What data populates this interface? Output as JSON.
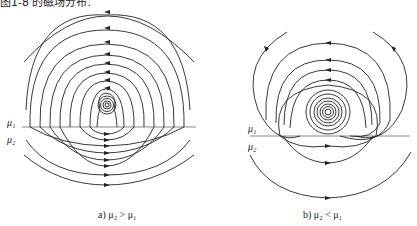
{
  "top_text": "图1-8 的磁场分布.",
  "figures": [
    {
      "id": "a",
      "caption": "a) μ₂ > μ₁",
      "label_upper": "μ₁",
      "label_lower": "μ₂"
    },
    {
      "id": "b",
      "caption": "b) μ₂ < μ₁",
      "label_upper": "μ₁",
      "label_lower": "μ₂"
    }
  ],
  "colors": {
    "line": "#222222",
    "interface": "#888888"
  }
}
